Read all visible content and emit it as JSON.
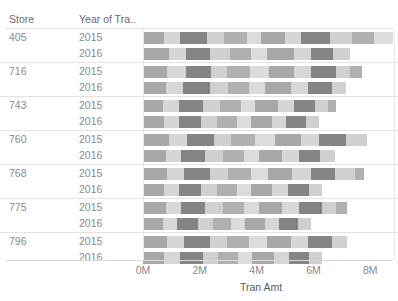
{
  "header": {
    "store_label": "Store",
    "year_label": "Year of Tra.."
  },
  "axis": {
    "title": "Tran Amt",
    "ticks": [
      "0M",
      "2M",
      "4M",
      "6M",
      "8M"
    ]
  },
  "colors": {
    "light": "#d6d6d6",
    "medium": "#a8a8a8",
    "dark": "#858585",
    "grid": "#e3e3e3",
    "text": "#8a8a8a"
  },
  "rows": [
    {
      "store": "405",
      "years": [
        {
          "year": "2015",
          "total": "8.3M"
        },
        {
          "year": "2016",
          "total": "6.7M"
        }
      ]
    },
    {
      "store": "716",
      "years": [
        {
          "year": "2015",
          "total": "7.1M"
        },
        {
          "year": "2016",
          "total": "6.6M"
        }
      ]
    },
    {
      "store": "743",
      "years": [
        {
          "year": "2015",
          "total": "6.2M"
        },
        {
          "year": "2016",
          "total": "5.5M"
        }
      ]
    },
    {
      "store": "760",
      "years": [
        {
          "year": "2015",
          "total": "7.7M"
        },
        {
          "year": "2016",
          "total": "6.3M"
        }
      ]
    },
    {
      "store": "768",
      "years": [
        {
          "year": "2015",
          "total": "7.2M"
        },
        {
          "year": "2016",
          "total": "5.9M"
        }
      ]
    },
    {
      "store": "775",
      "years": [
        {
          "year": "2015",
          "total": "6.6M"
        },
        {
          "year": "2016",
          "total": "5.3M"
        }
      ]
    },
    {
      "store": "796",
      "years": [
        {
          "year": "2015",
          "total": "7.0M"
        },
        {
          "year": "2016",
          "total": "5.7M"
        }
      ]
    }
  ],
  "chart_data": {
    "type": "bar",
    "title": "",
    "xlabel": "Tran Amt",
    "ylabel": "Store / Year of Transaction",
    "orientation": "horizontal",
    "stacked": true,
    "xlim": [
      0,
      8.8
    ],
    "xticks": [
      0,
      2,
      4,
      6,
      8
    ],
    "xtick_labels": [
      "0M",
      "2M",
      "4M",
      "6M",
      "8M"
    ],
    "grid": false,
    "legend": "none",
    "categories": [
      "405 / 2015",
      "405 / 2016",
      "716 / 2015",
      "716 / 2016",
      "743 / 2015",
      "743 / 2016",
      "760 / 2015",
      "760 / 2016",
      "768 / 2015",
      "768 / 2016",
      "775 / 2015",
      "775 / 2016",
      "796 / 2015",
      "796 / 2016"
    ],
    "totals": [
      8.3,
      6.7,
      7.1,
      6.6,
      6.2,
      5.5,
      7.7,
      6.3,
      7.2,
      5.9,
      6.6,
      5.3,
      7.0,
      5.7
    ],
    "segments": [
      [
        0.75,
        0.55,
        0.95,
        0.6,
        0.8,
        0.5,
        0.85,
        0.55,
        1.05,
        0.75,
        0.8,
        0.65
      ],
      [
        0.9,
        0.6,
        0.85,
        0.7,
        0.75,
        0.55,
        0.95,
        0.6,
        0.8,
        0.6
      ],
      [
        0.85,
        0.65,
        0.9,
        0.55,
        0.8,
        0.7,
        0.85,
        0.6,
        0.9,
        0.5,
        0.4
      ],
      [
        0.8,
        0.6,
        0.95,
        0.65,
        0.75,
        0.55,
        0.9,
        0.6,
        0.85,
        0.5
      ],
      [
        0.7,
        0.55,
        0.85,
        0.6,
        0.75,
        0.5,
        0.8,
        0.55,
        0.75,
        0.45,
        0.3
      ],
      [
        0.75,
        0.5,
        0.8,
        0.55,
        0.7,
        0.5,
        0.75,
        0.5,
        0.7,
        0.45
      ],
      [
        0.9,
        0.65,
        0.95,
        0.6,
        0.85,
        0.7,
        0.9,
        0.65,
        0.95,
        0.75
      ],
      [
        0.8,
        0.55,
        0.85,
        0.6,
        0.75,
        0.55,
        0.8,
        0.6,
        0.75,
        0.5
      ],
      [
        0.85,
        0.6,
        0.9,
        0.65,
        0.8,
        0.6,
        0.85,
        0.65,
        0.85,
        0.7,
        0.35
      ],
      [
        0.75,
        0.5,
        0.8,
        0.55,
        0.7,
        0.5,
        0.75,
        0.55,
        0.75,
        0.45
      ],
      [
        0.8,
        0.55,
        0.85,
        0.6,
        0.75,
        0.55,
        0.8,
        0.6,
        0.8,
        0.5,
        0.4
      ],
      [
        0.7,
        0.5,
        0.75,
        0.5,
        0.65,
        0.5,
        0.7,
        0.5,
        0.65,
        0.45
      ],
      [
        0.85,
        0.6,
        0.9,
        0.6,
        0.8,
        0.6,
        0.85,
        0.6,
        0.85,
        0.55
      ],
      [
        0.75,
        0.55,
        0.8,
        0.55,
        0.7,
        0.5,
        0.75,
        0.55,
        0.7,
        0.45
      ]
    ],
    "segment_palette": [
      "#a8a8a8",
      "#d6d6d6",
      "#858585",
      "#d0d0d0",
      "#b0b0b0",
      "#dcdcdc"
    ]
  }
}
